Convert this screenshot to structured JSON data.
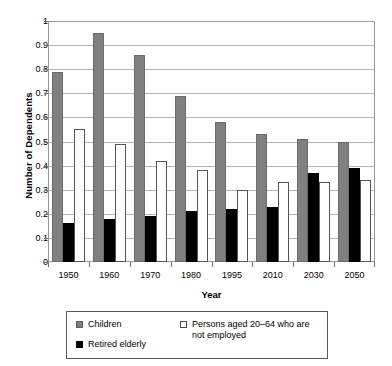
{
  "chart_data": {
    "type": "bar",
    "title": "",
    "xlabel": "Year",
    "ylabel": "Number of Dependents",
    "ylim": [
      0,
      1
    ],
    "ytick_labels": [
      "1",
      "0.9",
      "0.8",
      "0.7",
      "0.6",
      "0.5",
      "0.4",
      "0.3",
      "0.2",
      "0.1",
      "0"
    ],
    "ytick_values": [
      1,
      0.9,
      0.8,
      0.7,
      0.6,
      0.5,
      0.4,
      0.3,
      0.2,
      0.1,
      0
    ],
    "grid": true,
    "legend_position": "bottom",
    "categories": [
      "1950",
      "1960",
      "1970",
      "1980",
      "1995",
      "2010",
      "2030",
      "2050"
    ],
    "series": [
      {
        "name": "Children",
        "color": "#808080",
        "values": [
          0.79,
          0.95,
          0.86,
          0.69,
          0.58,
          0.53,
          0.51,
          0.5
        ]
      },
      {
        "name": "Retired elderly",
        "color": "#000000",
        "values": [
          0.16,
          0.18,
          0.19,
          0.21,
          0.22,
          0.23,
          0.37,
          0.39
        ]
      },
      {
        "name": "Persons aged 20–64 who are not employed",
        "color": "#ffffff",
        "values": [
          0.55,
          0.49,
          0.42,
          0.38,
          0.3,
          0.33,
          0.33,
          0.34
        ]
      }
    ]
  },
  "legend": {
    "children_label": "Children",
    "retired_label": "Retired elderly",
    "notemployed_label": "Persons aged 20–64 who are not employed"
  }
}
